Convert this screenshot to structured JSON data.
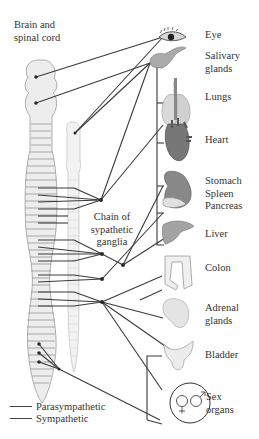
{
  "labels": {
    "brain": "Brain and\nspinal cord",
    "chain": "Chain of\nsypathetic\nganglia"
  },
  "organs": [
    {
      "id": "eye",
      "label": "Eye"
    },
    {
      "id": "salivary",
      "label": "Salivary\nglands"
    },
    {
      "id": "lungs",
      "label": "Lungs"
    },
    {
      "id": "heart",
      "label": "Heart"
    },
    {
      "id": "stomach",
      "label": "Stomach\nSpleen\nPancreas"
    },
    {
      "id": "liver",
      "label": "Liver"
    },
    {
      "id": "colon",
      "label": "Colon"
    },
    {
      "id": "adrenal",
      "label": "Adrenal\nglands"
    },
    {
      "id": "bladder",
      "label": "Bladder"
    },
    {
      "id": "sex",
      "label": "Sex\norgans"
    }
  ],
  "legend": [
    {
      "label": "Parasympathetic"
    },
    {
      "label": "Sympathetic"
    }
  ],
  "colors": {
    "line": "#3a3a3a",
    "cord_fill": "#ececec",
    "cord_stroke": "#9a9a9a",
    "organ_fill": "#8a8a8a"
  }
}
